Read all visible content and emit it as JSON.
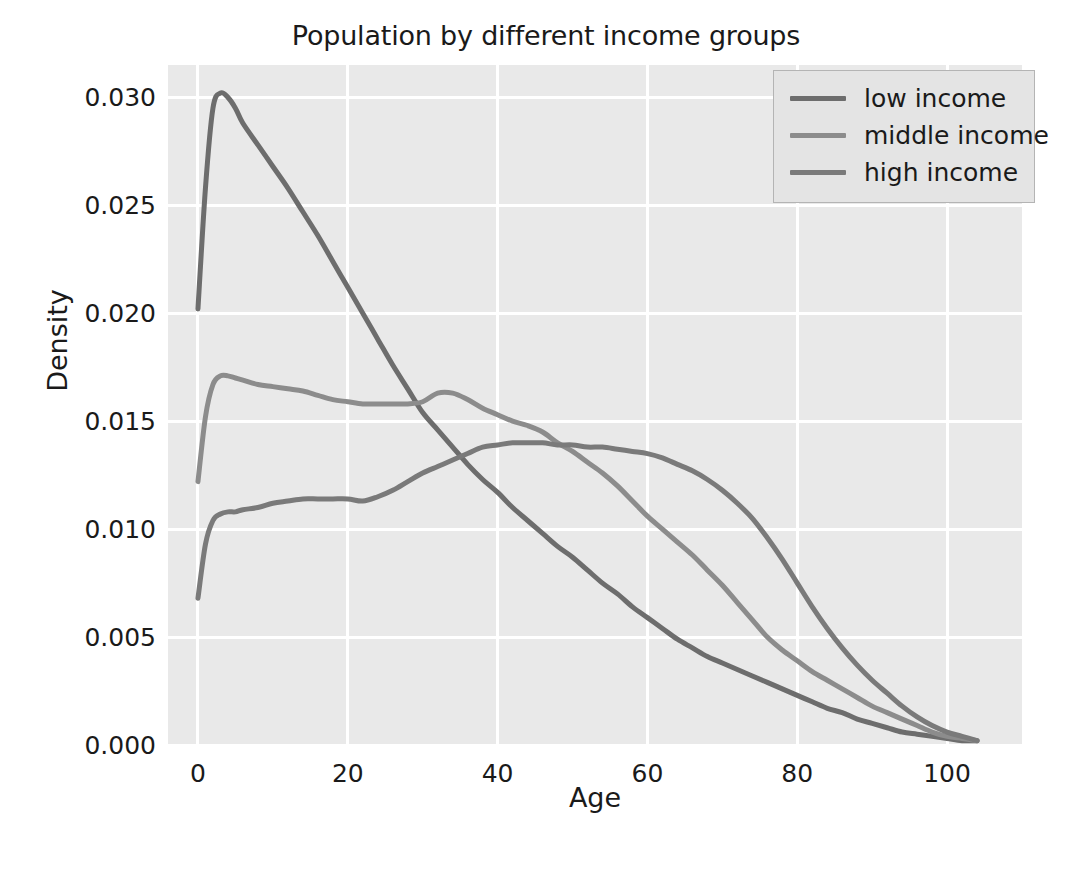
{
  "chart_data": {
    "type": "line",
    "title": "Population by different income groups",
    "xlabel": "Age",
    "ylabel": "Density",
    "xlim": [
      -4,
      110
    ],
    "ylim": [
      0.0,
      0.0315
    ],
    "grid": true,
    "legend_position": "upper right",
    "plot_bgcolor": "#e9e9e9",
    "grid_color": "#ffffff",
    "xticks": [
      0,
      20,
      40,
      60,
      80,
      100
    ],
    "xtick_labels": [
      "0",
      "20",
      "40",
      "60",
      "80",
      "100"
    ],
    "yticks": [
      0.0,
      0.005,
      0.01,
      0.015,
      0.02,
      0.025,
      0.03
    ],
    "ytick_labels": [
      "0.000",
      "0.005",
      "0.010",
      "0.015",
      "0.020",
      "0.025",
      "0.030"
    ],
    "x": [
      0,
      1,
      2,
      3,
      4,
      5,
      6,
      8,
      10,
      12,
      14,
      16,
      18,
      20,
      22,
      24,
      26,
      28,
      30,
      32,
      34,
      36,
      38,
      40,
      42,
      44,
      46,
      48,
      50,
      52,
      54,
      56,
      58,
      60,
      62,
      64,
      66,
      68,
      70,
      72,
      74,
      76,
      78,
      80,
      82,
      84,
      86,
      88,
      90,
      92,
      94,
      96,
      98,
      100,
      102,
      104
    ],
    "series": [
      {
        "name": "low income",
        "color": "#6d6d6d",
        "values": [
          0.0202,
          0.0258,
          0.0295,
          0.0302,
          0.03,
          0.0295,
          0.0288,
          0.0278,
          0.0268,
          0.0258,
          0.0247,
          0.0236,
          0.0224,
          0.0212,
          0.02,
          0.0188,
          0.0176,
          0.0165,
          0.0154,
          0.0146,
          0.0138,
          0.013,
          0.0123,
          0.0117,
          0.011,
          0.0104,
          0.0098,
          0.0092,
          0.0087,
          0.0081,
          0.0075,
          0.007,
          0.0064,
          0.0059,
          0.0054,
          0.0049,
          0.0045,
          0.0041,
          0.0038,
          0.0035,
          0.0032,
          0.0029,
          0.0026,
          0.0023,
          0.002,
          0.0017,
          0.0015,
          0.0012,
          0.001,
          0.0008,
          0.0006,
          0.0005,
          0.0004,
          0.0003,
          0.0002,
          0.0002
        ]
      },
      {
        "name": "middle income",
        "color": "#8c8c8c",
        "values": [
          0.0122,
          0.0152,
          0.0167,
          0.0171,
          0.0171,
          0.017,
          0.0169,
          0.0167,
          0.0166,
          0.0165,
          0.0164,
          0.0162,
          0.016,
          0.0159,
          0.0158,
          0.0158,
          0.0158,
          0.0158,
          0.0159,
          0.0163,
          0.0163,
          0.016,
          0.0156,
          0.0153,
          0.015,
          0.0148,
          0.0145,
          0.014,
          0.0136,
          0.0131,
          0.0126,
          0.012,
          0.0113,
          0.0106,
          0.01,
          0.0094,
          0.0088,
          0.0081,
          0.0074,
          0.0066,
          0.0058,
          0.005,
          0.0044,
          0.0039,
          0.0034,
          0.003,
          0.0026,
          0.0022,
          0.0018,
          0.0015,
          0.0012,
          0.0009,
          0.0006,
          0.0004,
          0.0003,
          0.0002
        ]
      },
      {
        "name": "high income",
        "color": "#7a7a7a",
        "values": [
          0.0068,
          0.0093,
          0.0104,
          0.0107,
          0.0108,
          0.0108,
          0.0109,
          0.011,
          0.0112,
          0.0113,
          0.0114,
          0.0114,
          0.0114,
          0.0114,
          0.0113,
          0.0115,
          0.0118,
          0.0122,
          0.0126,
          0.0129,
          0.0132,
          0.0135,
          0.0138,
          0.0139,
          0.014,
          0.014,
          0.014,
          0.0139,
          0.0139,
          0.0138,
          0.0138,
          0.0137,
          0.0136,
          0.0135,
          0.0133,
          0.013,
          0.0127,
          0.0123,
          0.0118,
          0.0112,
          0.0105,
          0.0096,
          0.0086,
          0.0075,
          0.0064,
          0.0054,
          0.0045,
          0.0037,
          0.003,
          0.0024,
          0.0018,
          0.0013,
          0.0009,
          0.0006,
          0.0004,
          0.0002
        ]
      }
    ]
  }
}
